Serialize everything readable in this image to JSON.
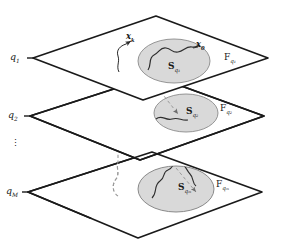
{
  "figure": {
    "type": "layered-manifold-diagram",
    "background_color": "#ffffff",
    "line_color": "#1a1a1a",
    "ellipse_fill": "#d8d8d8",
    "ellipse_stroke": "#8a8a8a",
    "dashed_color": "#9a9a9a"
  },
  "layers": [
    {
      "id": "layer-1",
      "left_label": "q",
      "left_sub": "1",
      "plane_label": "F",
      "plane_sub": "q₁",
      "region_label": "S",
      "region_sub": "q₁"
    },
    {
      "id": "layer-2",
      "left_label": "q",
      "left_sub": "2",
      "plane_label": "F",
      "plane_sub": "q₂",
      "region_label": "S",
      "region_sub": "q₂"
    },
    {
      "id": "layer-M",
      "left_label": "q",
      "left_sub": "M",
      "plane_label": "F",
      "plane_sub": "qₘ",
      "region_label": "S",
      "region_sub": "qₘ"
    }
  ],
  "ellipsis": {
    "symbol": "⋮",
    "meaning": "vertical-dots-continuation"
  },
  "points": [
    {
      "id": "point-xk",
      "label": "x",
      "sub": "k"
    },
    {
      "id": "point-x0",
      "label": "x",
      "sub": "0"
    }
  ],
  "labels": {
    "q1": "q",
    "q1_sub": "1",
    "q2": "q",
    "q2_sub": "2",
    "qM": "q",
    "qM_sub": "M",
    "F1": "F",
    "F1_sub": "q₁",
    "F2": "F",
    "F2_sub": "q₂",
    "FM": "F",
    "FM_sub": "qₘ",
    "S1": "S",
    "S1_sub": "q₁",
    "S2": "S",
    "S2_sub": "q₂",
    "SM": "S",
    "SM_sub": "qₘ",
    "xk": "x",
    "xk_sub": "k",
    "x0": "x",
    "x0_sub": "0",
    "dots": "⋮"
  }
}
